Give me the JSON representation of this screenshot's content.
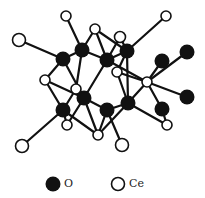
{
  "figure": {
    "type": "crystal-structure-ball-and-stick",
    "colors": {
      "oxygen": "#111111",
      "cerium": "#ffffff",
      "bond": "#111111",
      "outline": "#111111"
    },
    "atoms": [
      {
        "id": "ce1",
        "el": "Ce",
        "x": 66,
        "y": 16,
        "r": 5
      },
      {
        "id": "ce2",
        "el": "Ce",
        "x": 166,
        "y": 16,
        "r": 5
      },
      {
        "id": "ce3",
        "el": "Ce",
        "x": 19,
        "y": 40,
        "r": 6.5
      },
      {
        "id": "ce4",
        "el": "Ce",
        "x": 95,
        "y": 29,
        "r": 5
      },
      {
        "id": "ce5",
        "el": "Ce",
        "x": 120,
        "y": 37,
        "r": 5.5
      },
      {
        "id": "ce6",
        "el": "Ce",
        "x": 45,
        "y": 80,
        "r": 5
      },
      {
        "id": "ce7",
        "el": "Ce",
        "x": 76,
        "y": 89,
        "r": 5
      },
      {
        "id": "ce8",
        "el": "Ce",
        "x": 117,
        "y": 72,
        "r": 5
      },
      {
        "id": "ce9",
        "el": "Ce",
        "x": 147,
        "y": 82,
        "r": 5
      },
      {
        "id": "ce10",
        "el": "Ce",
        "x": 67,
        "y": 125,
        "r": 5
      },
      {
        "id": "ce11",
        "el": "Ce",
        "x": 98,
        "y": 135,
        "r": 5
      },
      {
        "id": "ce12",
        "el": "Ce",
        "x": 167,
        "y": 125,
        "r": 5
      },
      {
        "id": "ce13",
        "el": "Ce",
        "x": 22,
        "y": 146,
        "r": 6.5
      },
      {
        "id": "ce14",
        "el": "Ce",
        "x": 122,
        "y": 145,
        "r": 6.5
      },
      {
        "id": "o1",
        "el": "O",
        "x": 63,
        "y": 59,
        "r": 7.5
      },
      {
        "id": "o2",
        "el": "O",
        "x": 82,
        "y": 50,
        "r": 7.5
      },
      {
        "id": "o3",
        "el": "O",
        "x": 107,
        "y": 60,
        "r": 7.5
      },
      {
        "id": "o4",
        "el": "O",
        "x": 127,
        "y": 51,
        "r": 7.5
      },
      {
        "id": "o5",
        "el": "O",
        "x": 162,
        "y": 61,
        "r": 7.5
      },
      {
        "id": "o6",
        "el": "O",
        "x": 187,
        "y": 52,
        "r": 7.5
      },
      {
        "id": "o7",
        "el": "O",
        "x": 187,
        "y": 97,
        "r": 7.5
      },
      {
        "id": "o8",
        "el": "O",
        "x": 162,
        "y": 109,
        "r": 7.5
      },
      {
        "id": "o9",
        "el": "O",
        "x": 63,
        "y": 110,
        "r": 7.5
      },
      {
        "id": "o10",
        "el": "O",
        "x": 84,
        "y": 98,
        "r": 7.5
      },
      {
        "id": "o11",
        "el": "O",
        "x": 107,
        "y": 110,
        "r": 7.5
      },
      {
        "id": "o12",
        "el": "O",
        "x": 128,
        "y": 103,
        "r": 7.5
      }
    ],
    "bonds": [
      [
        "ce1",
        "o2"
      ],
      [
        "ce3",
        "o1"
      ],
      [
        "ce2",
        "o4"
      ],
      [
        "o1",
        "o2"
      ],
      [
        "o2",
        "ce4"
      ],
      [
        "ce4",
        "o3"
      ],
      [
        "o2",
        "o3"
      ],
      [
        "ce4",
        "o4"
      ],
      [
        "o3",
        "ce5"
      ],
      [
        "ce5",
        "o4"
      ],
      [
        "o3",
        "o4"
      ],
      [
        "o1",
        "ce6"
      ],
      [
        "o1",
        "o10"
      ],
      [
        "o2",
        "ce7"
      ],
      [
        "o3",
        "o10"
      ],
      [
        "o3",
        "ce9"
      ],
      [
        "o4",
        "ce8"
      ],
      [
        "o4",
        "o12"
      ],
      [
        "ce6",
        "o9"
      ],
      [
        "ce6",
        "o10"
      ],
      [
        "ce7",
        "o9"
      ],
      [
        "ce7",
        "o10"
      ],
      [
        "ce8",
        "o12"
      ],
      [
        "ce8",
        "ce9"
      ],
      [
        "o9",
        "ce10"
      ],
      [
        "o9",
        "ce13"
      ],
      [
        "o9",
        "ce11"
      ],
      [
        "o10",
        "o11"
      ],
      [
        "o10",
        "ce10"
      ],
      [
        "o11",
        "ce11"
      ],
      [
        "o11",
        "o12"
      ],
      [
        "o11",
        "ce14"
      ],
      [
        "o12",
        "ce11"
      ],
      [
        "o12",
        "ce9"
      ],
      [
        "o12",
        "ce12"
      ],
      [
        "ce9",
        "o5"
      ],
      [
        "ce9",
        "o6"
      ],
      [
        "ce9",
        "o7"
      ],
      [
        "ce9",
        "o8"
      ],
      [
        "o8",
        "ce12"
      ],
      [
        "o10",
        "ce11"
      ]
    ]
  },
  "legend": {
    "items": [
      {
        "symbol": "filled-circle",
        "label": "O",
        "x": 53,
        "y": 184,
        "r": 7.5
      },
      {
        "symbol": "open-circle",
        "label": "Ce",
        "x": 118,
        "y": 184,
        "r": 6.5
      }
    ]
  }
}
